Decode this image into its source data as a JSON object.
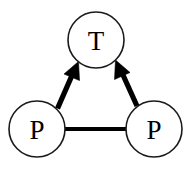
{
  "diagram": {
    "canvas": {
      "width": 194,
      "height": 175,
      "background": "#ffffff"
    },
    "stroke_color": "#000000",
    "node_stroke_color": "#1a1a1a",
    "node_fill_color": "#ffffff",
    "nodes": [
      {
        "id": "t-top",
        "label": "T",
        "cx": 96,
        "cy": 40,
        "r": 28
      },
      {
        "id": "p-left",
        "label": "P",
        "cx": 37,
        "cy": 129,
        "r": 28
      },
      {
        "id": "p-right",
        "label": "P",
        "cx": 154,
        "cy": 129,
        "r": 28
      }
    ],
    "edges": [
      {
        "id": "p-left-to-t",
        "from": "p-left",
        "to": "t-top",
        "kind": "arrow",
        "direction": "up-right"
      },
      {
        "id": "p-right-to-t",
        "from": "p-right",
        "to": "t-top",
        "kind": "arrow",
        "direction": "up-left"
      },
      {
        "id": "p-left-to-p-right",
        "from": "p-left",
        "to": "p-right",
        "kind": "line",
        "direction": "horizontal"
      }
    ]
  }
}
